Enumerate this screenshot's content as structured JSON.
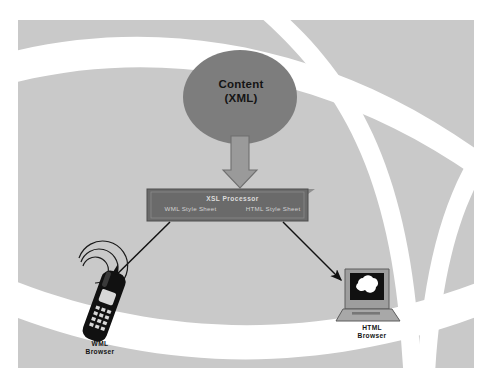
{
  "diagram": {
    "background_color": "#c9c9c9",
    "curve_color": "#ffffff",
    "source": {
      "shape": "ellipse",
      "fill_color": "#7d7d7d",
      "line1": "Content",
      "line2": "(XML)"
    },
    "flow_arrow": {
      "name": "thick-down-arrow",
      "direction": "down",
      "fill_color": "#9a9a9a"
    },
    "processor": {
      "shape": "box-3d",
      "fill_color": "#6a6a6a",
      "title": "XSL Processor",
      "stylesheets": [
        "WML Style Sheet",
        "HTML Style Sheet"
      ]
    },
    "branches": [
      {
        "arrow_name": "arrow-to-wml",
        "target_icon": "mobile-phone-icon",
        "signal_icon": "signal-waves-icon",
        "label_line1": "WML",
        "label_line2": "Browser",
        "color": "#111111"
      },
      {
        "arrow_name": "arrow-to-html",
        "target_icon": "laptop-icon",
        "screen_icon": "cloud-icon",
        "label_line1": "HTML",
        "label_line2": "Browser",
        "color": "#111111"
      }
    ]
  }
}
